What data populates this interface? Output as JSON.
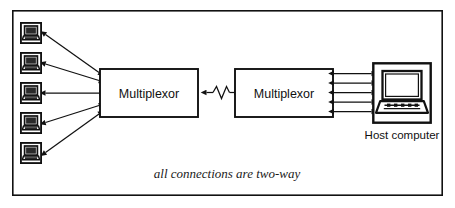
{
  "figure": {
    "background_color": "#ffffff",
    "line_color": "#111111",
    "border": {
      "name": "figure-border",
      "x": 12,
      "y": 10,
      "width": 431,
      "height": 186,
      "stroke_width": 1.6
    }
  },
  "terminals": {
    "count": 5,
    "icon_name": "terminal-icon",
    "items": [
      {
        "id": "terminal-1",
        "label": "",
        "x": 20,
        "y": 22
      },
      {
        "id": "terminal-2",
        "label": "",
        "x": 20,
        "y": 52
      },
      {
        "id": "terminal-3",
        "label": "",
        "x": 20,
        "y": 82
      },
      {
        "id": "terminal-4",
        "label": "",
        "x": 20,
        "y": 112
      },
      {
        "id": "terminal-5",
        "label": "",
        "x": 20,
        "y": 142
      }
    ]
  },
  "nodes": {
    "multiplexor_left": {
      "label": "Multiplexor",
      "x": 100,
      "y": 69,
      "width": 98,
      "height": 48
    },
    "multiplexor_right": {
      "label": "Multiplexor",
      "x": 235,
      "y": 69,
      "width": 98,
      "height": 48
    },
    "host_computer": {
      "label": "Host computer",
      "icon_name": "desktop-computer-icon",
      "x": 372,
      "y": 62,
      "width": 60,
      "height": 62
    }
  },
  "links": {
    "trunk": {
      "name": "multiplexor-trunk-link",
      "style": "zigzag",
      "arrowheads": "both",
      "from": "multiplexor_left",
      "to": "multiplexor_right"
    },
    "terminal_links_arrowheads": "both",
    "host_links_count": 5,
    "host_links_arrowheads": "both"
  },
  "caption": {
    "text": "all connections are two-way",
    "style": "italic-serif",
    "x": 227,
    "y": 178
  },
  "colors": {
    "stroke": "#111111",
    "fill_white": "#ffffff",
    "screen_dark": "#1d1d1d",
    "paper": "#ffffff"
  }
}
